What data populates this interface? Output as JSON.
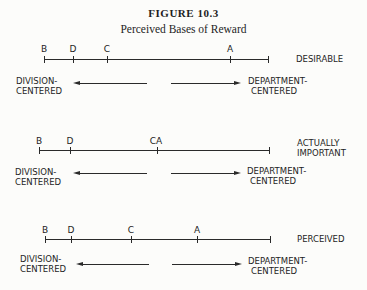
{
  "figure": {
    "title": "FIGURE 10.3",
    "subtitle": "Perceived Bases of Reward"
  },
  "axis_labels": {
    "left": [
      "DIVISION-",
      "CENTERED"
    ],
    "right": [
      "DEPARTMENT-",
      "CENTERED"
    ]
  },
  "panels": [
    {
      "name": "DESIRABLE",
      "label_lines": [
        "DESIRABLE"
      ],
      "points": [
        {
          "label": "B",
          "x": 44
        },
        {
          "label": "D",
          "x": 73
        },
        {
          "label": "C",
          "x": 107
        },
        {
          "label": "A",
          "x": 230
        }
      ],
      "line_start": 44,
      "line_end": 268
    },
    {
      "name": "ACTUALLY IMPORTANT",
      "label_lines": [
        "ACTUALLY",
        "IMPORTANT"
      ],
      "points": [
        {
          "label": "B",
          "x": 39
        },
        {
          "label": "D",
          "x": 70
        },
        {
          "label": "CA",
          "x": 157
        }
      ],
      "line_start": 39,
      "line_end": 269
    },
    {
      "name": "PERCEIVED",
      "label_lines": [
        "PERCEIVED"
      ],
      "points": [
        {
          "label": "B",
          "x": 45
        },
        {
          "label": "D",
          "x": 71
        },
        {
          "label": "C",
          "x": 131
        },
        {
          "label": "A",
          "x": 197
        }
      ],
      "line_start": 45,
      "line_end": 270
    }
  ]
}
